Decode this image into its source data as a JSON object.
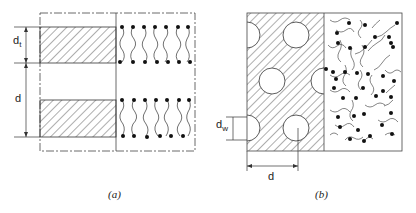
{
  "figure": {
    "panels": [
      {
        "id": "a",
        "caption": "(a)",
        "description": "Lamellar phase: alternating water layers and lipid bilayers",
        "dimension_labels": {
          "bilayer_thickness": "d",
          "bilayer_thickness_sub": "t",
          "period": "d"
        }
      },
      {
        "id": "b",
        "caption": "(b)",
        "description": "Hexagonal phase: water cylinders in lipid matrix",
        "dimension_labels": {
          "water_diameter": "d",
          "water_diameter_sub": "w",
          "period": "d"
        }
      }
    ],
    "colors": {
      "line": "#222222",
      "background": "#ffffff"
    }
  }
}
